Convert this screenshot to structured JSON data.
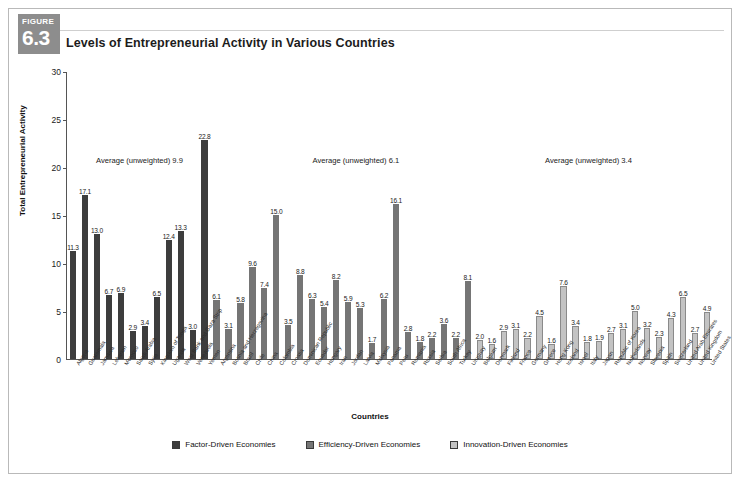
{
  "figure": {
    "word": "FIGURE",
    "number": "6.3"
  },
  "header": {
    "title": "Levels of Entrepreneurial Activity in Various Countries"
  },
  "legend": [
    {
      "label": "Factor-Driven Economies",
      "color": "#3d3d3d"
    },
    {
      "label": "Efficiency-Driven Economies",
      "color": "#757575"
    },
    {
      "label": "Innovation-Driven Economies",
      "color": "#c3c3c3"
    }
  ],
  "annotations": [
    {
      "text": "Average (unweighted) 9.9",
      "x_pct": 4.5,
      "y_value": 21.3
    },
    {
      "text": "Average (unweighted) 6.1",
      "x_pct": 38.0,
      "y_value": 21.3
    },
    {
      "text": "Average (unweighted) 3.4",
      "x_pct": 74.0,
      "y_value": 21.3
    }
  ],
  "chart_data": {
    "type": "bar",
    "title": "Levels of Entrepreneurial Activity in Various Countries",
    "xlabel": "Countries",
    "ylabel": "Total Entrepreneurial Activity",
    "ylim": [
      0,
      30
    ],
    "yticks": [
      0,
      5,
      10,
      15,
      20,
      25,
      30
    ],
    "grid": false,
    "legend_position": "bottom",
    "categories": [
      "Algeria",
      "Guatemala",
      "Jamaica",
      "Lebanon",
      "Morocco",
      "Saudi Arabia",
      "Syria",
      "Kingdom of Tonga",
      "Uganda",
      "West Bank and Gaza Strip",
      "Venezuela",
      "Yemen",
      "Argentina",
      "Bosnia and Herzegovina",
      "Brazil",
      "Chile",
      "China",
      "Colombia",
      "Croatia",
      "Dominican Republic",
      "Ecuador",
      "Hungary",
      "Iran",
      "Jordan",
      "Latvia",
      "Malaysia",
      "Panama",
      "Peru",
      "Romania",
      "Russia",
      "Serbia",
      "South Africa",
      "Turkey",
      "Uruguay",
      "Belgium",
      "Denmark",
      "Finland",
      "France",
      "Germany",
      "Greece",
      "Hong Kong",
      "Iceland",
      "Israel",
      "Italy",
      "Japan",
      "Republic of Korea",
      "Netherlands",
      "Norway",
      "Slovenia",
      "Spain",
      "Switzerland",
      "United Arab Emirates",
      "United Kingdom",
      "United States"
    ],
    "values": [
      11.3,
      17.1,
      13.0,
      6.7,
      6.9,
      2.9,
      3.4,
      6.5,
      12.4,
      13.3,
      3.0,
      22.8,
      6.1,
      3.1,
      5.8,
      9.6,
      7.4,
      15.0,
      3.5,
      8.8,
      6.3,
      5.4,
      8.2,
      5.9,
      5.3,
      1.7,
      6.2,
      16.1,
      2.8,
      1.8,
      2.2,
      3.6,
      2.2,
      8.1,
      2.0,
      1.6,
      2.9,
      3.1,
      2.2,
      4.5,
      1.6,
      7.6,
      3.4,
      1.8,
      1.9,
      2.7,
      3.1,
      5.0,
      3.2,
      2.3,
      4.3,
      6.5,
      2.7,
      4.9
    ],
    "groups": [
      {
        "name": "Factor-Driven Economies",
        "start": 0,
        "end": 11,
        "average_unweighted": 9.9,
        "color": "#3d3d3d"
      },
      {
        "name": "Efficiency-Driven Economies",
        "start": 12,
        "end": 33,
        "average_unweighted": 6.1,
        "color": "#757575"
      },
      {
        "name": "Innovation-Driven Economies",
        "start": 34,
        "end": 53,
        "average_unweighted": 3.4,
        "color": "#c3c3c3"
      }
    ]
  }
}
